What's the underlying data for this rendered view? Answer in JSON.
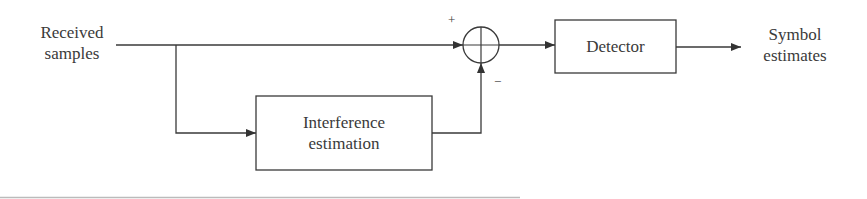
{
  "diagram": {
    "input_label": [
      "Received",
      "samples"
    ],
    "output_label": [
      "Symbol",
      "estimates"
    ],
    "blocks": {
      "detector": "Detector",
      "interference": [
        "Interference",
        "estimation"
      ]
    },
    "summing_junction": {
      "plus_sign": "+",
      "minus_sign": "−"
    },
    "colors": {
      "line": "#3a3a3a",
      "background": "#ffffff"
    }
  }
}
